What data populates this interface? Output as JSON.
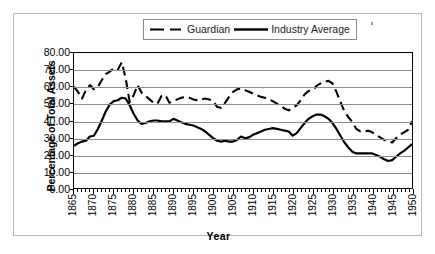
{
  "chart_data": {
    "type": "line",
    "title": "",
    "xlabel": "Year",
    "ylabel": "Percentage of Total Assets",
    "xlim": [
      1865,
      1950
    ],
    "ylim": [
      0,
      80
    ],
    "ytick_step": 10,
    "xtick_step": 5,
    "grid": true,
    "legend_position": "top-center",
    "ytick_labels": [
      "80.00",
      "70.00",
      "60.00",
      "50.00",
      "40.00",
      "30.00",
      "20.00",
      "10.00",
      "0.00"
    ],
    "ytick_values": [
      80,
      70,
      60,
      50,
      40,
      30,
      20,
      10,
      0
    ],
    "xtick_labels": [
      "1865",
      "1870",
      "1875",
      "1880",
      "1885",
      "1890",
      "1895",
      "1900",
      "1905",
      "1910",
      "1915",
      "1920",
      "1925",
      "1930",
      "1935",
      "1940",
      "1945",
      "1950"
    ],
    "xtick_values": [
      1865,
      1870,
      1875,
      1880,
      1885,
      1890,
      1895,
      1900,
      1905,
      1910,
      1915,
      1920,
      1925,
      1930,
      1935,
      1940,
      1945,
      1950
    ],
    "series": [
      {
        "name": "Guardian",
        "style": "dashed",
        "color": "#000000",
        "x": [
          1865,
          1866,
          1867,
          1868,
          1869,
          1870,
          1871,
          1872,
          1873,
          1874,
          1875,
          1876,
          1877,
          1878,
          1879,
          1880,
          1881,
          1882,
          1883,
          1884,
          1885,
          1886,
          1887,
          1888,
          1889,
          1890,
          1891,
          1892,
          1893,
          1894,
          1895,
          1896,
          1897,
          1898,
          1899,
          1900,
          1901,
          1902,
          1903,
          1904,
          1905,
          1906,
          1907,
          1908,
          1909,
          1910,
          1911,
          1912,
          1913,
          1914,
          1915,
          1916,
          1917,
          1918,
          1919,
          1920,
          1921,
          1922,
          1923,
          1924,
          1925,
          1926,
          1927,
          1928,
          1929,
          1930,
          1931,
          1932,
          1933,
          1934,
          1935,
          1936,
          1937,
          1938,
          1939,
          1940,
          1941,
          1942,
          1943,
          1944,
          1945,
          1946,
          1947,
          1948,
          1949,
          1950
        ],
        "y": [
          60.0,
          57.0,
          53.0,
          58.0,
          61.0,
          58.5,
          60.0,
          64.0,
          67.5,
          69.0,
          71.0,
          70.0,
          74.5,
          65.0,
          51.0,
          55.0,
          61.0,
          56.5,
          54.5,
          52.5,
          50.5,
          50.0,
          54.5,
          55.0,
          50.5,
          51.5,
          52.5,
          53.5,
          54.0,
          53.5,
          52.5,
          52.0,
          52.5,
          53.0,
          52.5,
          51.5,
          48.0,
          47.5,
          50.5,
          54.0,
          57.0,
          58.5,
          59.0,
          58.0,
          57.0,
          56.0,
          55.0,
          54.0,
          53.5,
          52.5,
          51.5,
          50.0,
          48.5,
          47.0,
          46.0,
          47.5,
          49.0,
          52.0,
          55.5,
          57.5,
          58.0,
          60.5,
          62.0,
          63.0,
          63.5,
          62.0,
          57.0,
          51.0,
          45.5,
          42.0,
          39.0,
          35.0,
          33.5,
          33.5,
          34.0,
          33.0,
          31.5,
          30.0,
          28.5,
          27.5,
          27.0,
          29.5,
          31.5,
          33.0,
          34.5,
          39.5
        ]
      },
      {
        "name": "Industry Average",
        "style": "solid",
        "color": "#000000",
        "x": [
          1865,
          1866,
          1867,
          1868,
          1869,
          1870,
          1871,
          1872,
          1873,
          1874,
          1875,
          1876,
          1877,
          1878,
          1879,
          1880,
          1881,
          1882,
          1883,
          1884,
          1885,
          1886,
          1887,
          1888,
          1889,
          1890,
          1891,
          1892,
          1893,
          1894,
          1895,
          1896,
          1897,
          1898,
          1899,
          1900,
          1901,
          1902,
          1903,
          1904,
          1905,
          1906,
          1907,
          1908,
          1909,
          1910,
          1911,
          1912,
          1913,
          1914,
          1915,
          1916,
          1917,
          1918,
          1919,
          1920,
          1921,
          1922,
          1923,
          1924,
          1925,
          1926,
          1927,
          1928,
          1929,
          1930,
          1931,
          1932,
          1933,
          1934,
          1935,
          1936,
          1937,
          1938,
          1939,
          1940,
          1941,
          1942,
          1943,
          1944,
          1945,
          1946,
          1947,
          1948,
          1949,
          1950
        ],
        "y": [
          25.0,
          26.5,
          27.5,
          28.0,
          30.5,
          31.0,
          35.0,
          40.0,
          45.5,
          49.5,
          51.5,
          52.0,
          53.5,
          53.0,
          49.0,
          44.0,
          40.0,
          38.0,
          38.5,
          39.5,
          40.0,
          40.0,
          39.5,
          39.5,
          39.5,
          41.0,
          40.0,
          39.0,
          38.0,
          37.5,
          37.0,
          36.0,
          35.0,
          33.5,
          31.5,
          29.5,
          28.0,
          27.5,
          28.0,
          27.5,
          27.5,
          28.5,
          30.5,
          29.5,
          30.0,
          31.5,
          32.5,
          33.5,
          34.5,
          35.0,
          35.5,
          35.0,
          34.5,
          34.0,
          33.5,
          31.0,
          32.5,
          35.5,
          38.5,
          41.0,
          42.5,
          43.5,
          43.5,
          42.5,
          41.0,
          38.5,
          35.0,
          31.0,
          27.0,
          24.0,
          21.5,
          20.5,
          20.5,
          20.5,
          20.5,
          20.5,
          19.5,
          18.5,
          17.0,
          16.0,
          16.5,
          18.5,
          20.5,
          22.0,
          24.0,
          26.0
        ]
      }
    ]
  },
  "legend": {
    "entries": [
      {
        "label": "Guardian",
        "swatch": "dashed-line-swatch"
      },
      {
        "label": "Industry Average",
        "swatch": "solid-line-swatch"
      }
    ]
  },
  "axes": {
    "y_title": "Percentage of Total Assets",
    "x_title": "Year"
  }
}
